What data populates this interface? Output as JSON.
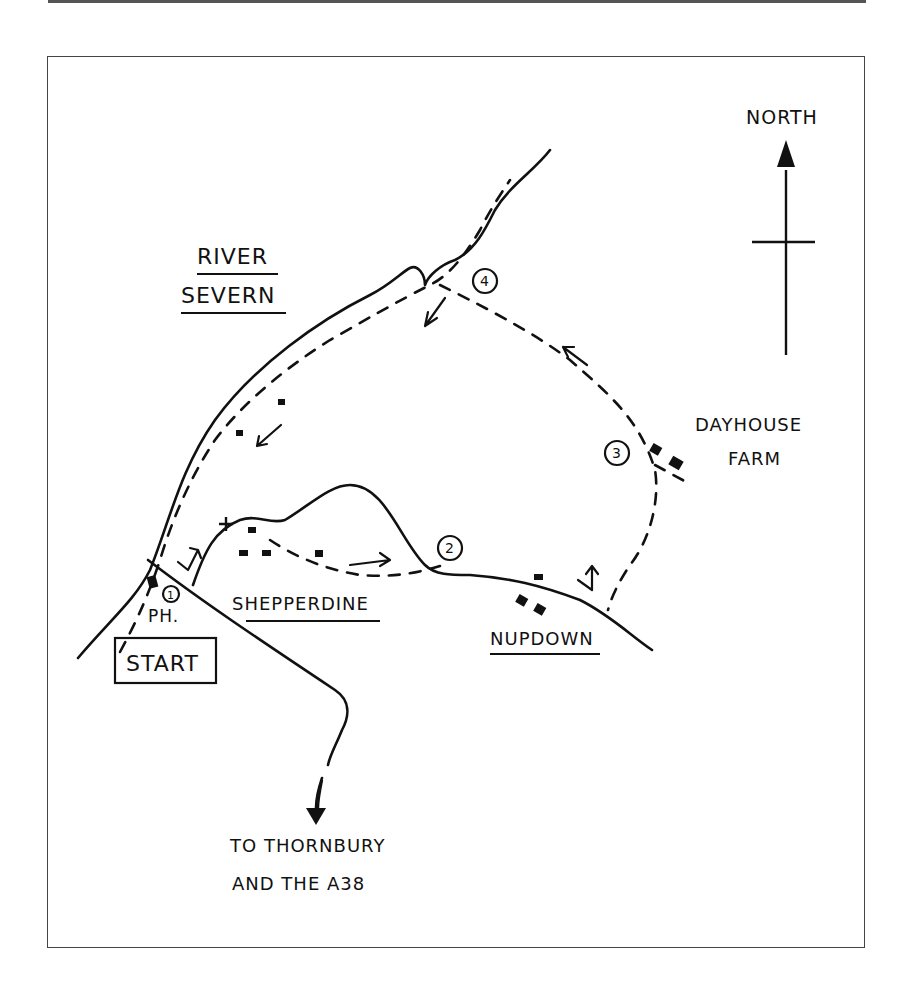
{
  "map": {
    "compass_label": "NORTH",
    "river_label_line1": "RIVER",
    "river_label_line2": "SEVERN",
    "village_shepperdine": "SHEPPERDINE",
    "village_nupdown": "NUPDOWN",
    "farm_line1": "DAYHOUSE",
    "farm_line2": "FARM",
    "pub_label": "PH.",
    "start_label": "START",
    "direction_line1": "TO THORNBURY",
    "direction_line2": "AND THE A38",
    "waypoints": [
      "1",
      "2",
      "3",
      "4"
    ]
  },
  "colors": {
    "ink": "#111111",
    "frame": "#444444",
    "background": "#ffffff"
  }
}
